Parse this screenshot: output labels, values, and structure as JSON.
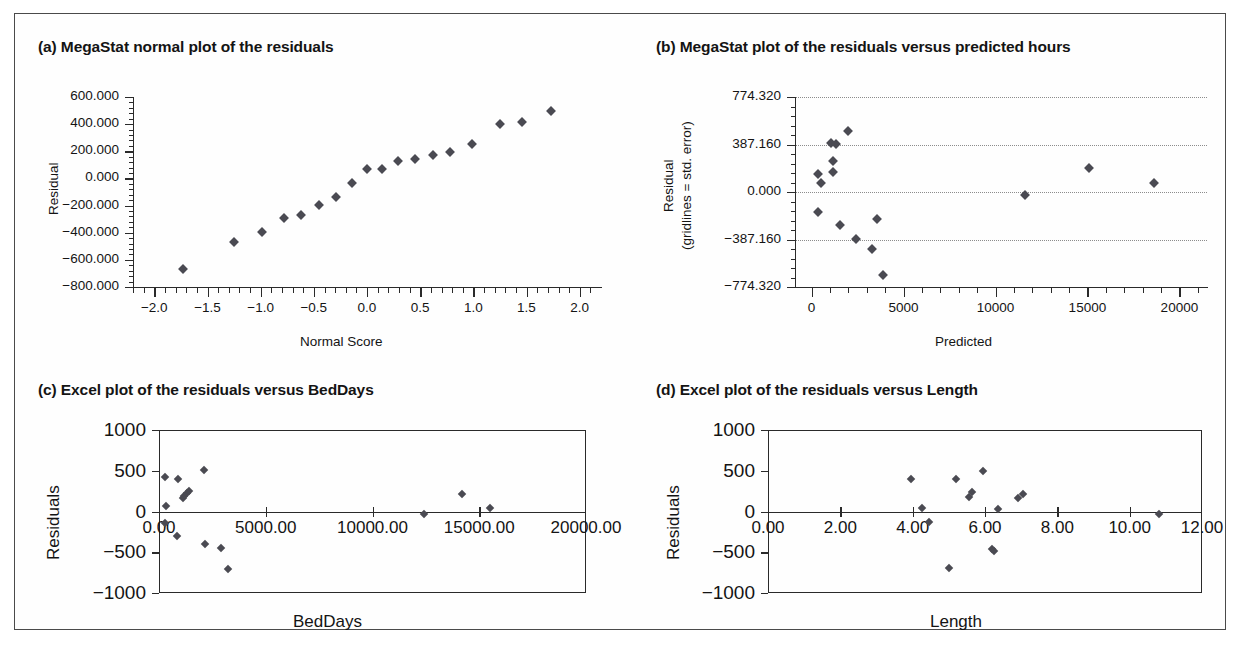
{
  "figure": {
    "panels": [
      {
        "id": "a",
        "title": "(a) MegaStat normal plot of the residuals",
        "xlabel": "Normal Score",
        "ylabel": "Residual"
      },
      {
        "id": "b",
        "title": "(b) MegaStat plot of the residuals versus predicted hours",
        "xlabel": "Predicted",
        "ylabel_line1": "Residual",
        "ylabel_line2": "(gridlines = std. error)"
      },
      {
        "id": "c",
        "title": "(c) Excel plot of the residuals versus BedDays",
        "xlabel": "BedDays",
        "ylabel": "Residuals"
      },
      {
        "id": "d",
        "title": "(d) Excel plot of the residuals versus Length",
        "xlabel": "Length",
        "ylabel": "Residuals"
      }
    ],
    "marker_color": "#4a4a52"
  },
  "chart_data": [
    {
      "type": "scatter",
      "panel": "a",
      "title": "(a) MegaStat normal plot of the residuals",
      "xlabel": "Normal Score",
      "ylabel": "Residual",
      "xlim": [
        -2.2,
        2.2
      ],
      "ylim": [
        -800,
        600
      ],
      "xticks": [
        -2.0,
        -1.5,
        -1.0,
        -0.5,
        0.0,
        0.5,
        1.0,
        1.5,
        2.0
      ],
      "xticklabels": [
        "−2.0",
        "−1.5",
        "−1.0",
        "−0.5",
        "0.0",
        "0.5",
        "1.0",
        "1.5",
        "2.0"
      ],
      "yticks": [
        600,
        400,
        200,
        0,
        -200,
        -400,
        -600,
        -800
      ],
      "yticklabels": [
        "600.000",
        "400.000",
        "200.000",
        "0.000",
        "−200.000",
        "−400.000",
        "−600.000",
        "−800.000"
      ],
      "grid": false,
      "minor_ticks": true,
      "points": [
        {
          "x": -1.73,
          "y": -670
        },
        {
          "x": -1.25,
          "y": -465
        },
        {
          "x": -0.99,
          "y": -393
        },
        {
          "x": -0.78,
          "y": -288
        },
        {
          "x": -0.62,
          "y": -266
        },
        {
          "x": -0.45,
          "y": -196
        },
        {
          "x": -0.29,
          "y": -136
        },
        {
          "x": -0.14,
          "y": -37
        },
        {
          "x": 0.0,
          "y": 68
        },
        {
          "x": 0.14,
          "y": 69
        },
        {
          "x": 0.29,
          "y": 127
        },
        {
          "x": 0.45,
          "y": 142
        },
        {
          "x": 0.62,
          "y": 173
        },
        {
          "x": 0.78,
          "y": 196
        },
        {
          "x": 0.99,
          "y": 251
        },
        {
          "x": 1.25,
          "y": 399
        },
        {
          "x": 1.46,
          "y": 413
        },
        {
          "x": 1.73,
          "y": 496
        }
      ]
    },
    {
      "type": "scatter",
      "panel": "b",
      "title": "(b) MegaStat plot of the residuals versus predicted hours",
      "xlabel": "Predicted",
      "ylabel": "Residual (gridlines = std. error)",
      "xlim": [
        -900,
        21500
      ],
      "ylim": [
        -774.32,
        774.32
      ],
      "xticks": [
        0,
        5000,
        10000,
        15000,
        20000
      ],
      "xticklabels": [
        "0",
        "5000",
        "10000",
        "15000",
        "20000"
      ],
      "yticks": [
        774.32,
        387.16,
        0.0,
        -387.16,
        -774.32
      ],
      "yticklabels": [
        "774.320",
        "387.160",
        "0.000",
        "−387.160",
        "−774.320"
      ],
      "grid": true,
      "gridlines_at": [
        774.32,
        387.16,
        0.0,
        -387.16
      ],
      "minor_ticks": true,
      "points": [
        {
          "x": 350,
          "y": 150
        },
        {
          "x": 500,
          "y": 70
        },
        {
          "x": 330,
          "y": -160
        },
        {
          "x": 1050,
          "y": 400
        },
        {
          "x": 1300,
          "y": 390
        },
        {
          "x": 1150,
          "y": 255
        },
        {
          "x": 1150,
          "y": 160
        },
        {
          "x": 1550,
          "y": -265
        },
        {
          "x": 2000,
          "y": 500
        },
        {
          "x": 2400,
          "y": -385
        },
        {
          "x": 3300,
          "y": -465
        },
        {
          "x": 3550,
          "y": -220
        },
        {
          "x": 3900,
          "y": -675
        },
        {
          "x": 11600,
          "y": -25
        },
        {
          "x": 15100,
          "y": 200
        },
        {
          "x": 18600,
          "y": 70
        }
      ]
    },
    {
      "type": "scatter",
      "panel": "c",
      "title": "(c) Excel plot of the residuals versus BedDays",
      "xlabel": "BedDays",
      "ylabel": "Residuals",
      "xlim": [
        0,
        20000
      ],
      "ylim": [
        -1000,
        1000
      ],
      "xticks": [
        0,
        5000,
        10000,
        15000,
        20000
      ],
      "xticklabels": [
        "0.00",
        "5000.00",
        "10000.00",
        "15000.00",
        "20000.00"
      ],
      "yticks": [
        1000,
        500,
        0,
        -500,
        -1000
      ],
      "yticklabels": [
        "1000",
        "500",
        "0",
        "−500",
        "−1000"
      ],
      "grid": false,
      "points": [
        {
          "x": 300,
          "y": 430
        },
        {
          "x": 320,
          "y": 65
        },
        {
          "x": 260,
          "y": -145
        },
        {
          "x": 900,
          "y": 400
        },
        {
          "x": 820,
          "y": -305
        },
        {
          "x": 1100,
          "y": 170
        },
        {
          "x": 1180,
          "y": 185
        },
        {
          "x": 1300,
          "y": 230
        },
        {
          "x": 1380,
          "y": 250
        },
        {
          "x": 2100,
          "y": 510
        },
        {
          "x": 2150,
          "y": -395
        },
        {
          "x": 2900,
          "y": -450
        },
        {
          "x": 3250,
          "y": -700
        },
        {
          "x": 12400,
          "y": -25
        },
        {
          "x": 14200,
          "y": 215
        },
        {
          "x": 15500,
          "y": 40
        }
      ]
    },
    {
      "type": "scatter",
      "panel": "d",
      "title": "(d) Excel plot of the residuals versus Length",
      "xlabel": "Length",
      "ylabel": "Residuals",
      "xlim": [
        0,
        12
      ],
      "ylim": [
        -1000,
        1000
      ],
      "xticks": [
        0,
        2,
        4,
        6,
        8,
        10,
        12
      ],
      "xticklabels": [
        "0.00",
        "2.00",
        "4.00",
        "6.00",
        "8.00",
        "10.00",
        "12.00"
      ],
      "yticks": [
        1000,
        500,
        0,
        -500,
        -1000
      ],
      "yticklabels": [
        "1000",
        "500",
        "0",
        "−500",
        "−1000"
      ],
      "grid": false,
      "points": [
        {
          "x": 3.95,
          "y": 400
        },
        {
          "x": 4.25,
          "y": 45
        },
        {
          "x": 4.45,
          "y": -130
        },
        {
          "x": 5.0,
          "y": -690
        },
        {
          "x": 5.2,
          "y": 400
        },
        {
          "x": 5.55,
          "y": 180
        },
        {
          "x": 5.65,
          "y": 235
        },
        {
          "x": 5.95,
          "y": 500
        },
        {
          "x": 6.2,
          "y": -455
        },
        {
          "x": 6.25,
          "y": -490
        },
        {
          "x": 6.35,
          "y": 35
        },
        {
          "x": 6.9,
          "y": 170
        },
        {
          "x": 7.05,
          "y": 215
        },
        {
          "x": 10.8,
          "y": -30
        }
      ]
    }
  ]
}
